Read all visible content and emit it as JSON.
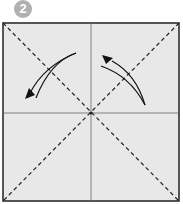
{
  "step": {
    "number": "2",
    "badge_color": "#b0b0b0"
  },
  "paper": {
    "fill": "#e8e8e8",
    "border": "#222222",
    "folds": [
      {
        "type": "valley-dashed",
        "from": "top-left",
        "to": "bottom-right"
      },
      {
        "type": "valley-dashed",
        "from": "top-right",
        "to": "bottom-left"
      },
      {
        "type": "crease",
        "orientation": "vertical"
      },
      {
        "type": "crease",
        "orientation": "horizontal"
      }
    ],
    "arrows": [
      {
        "name": "fold-arrow-left",
        "direction": "down-left"
      },
      {
        "name": "fold-arrow-right",
        "direction": "up-left"
      }
    ]
  }
}
